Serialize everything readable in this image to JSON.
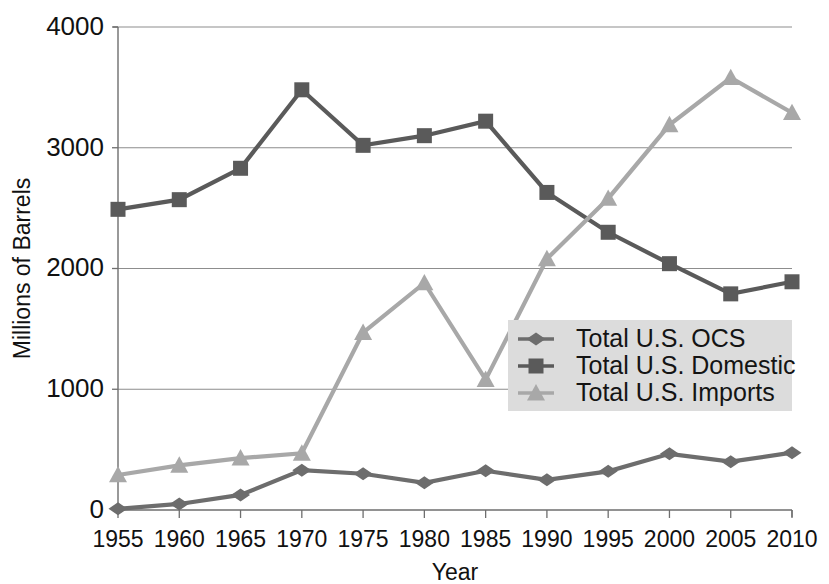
{
  "chart_data": {
    "type": "line",
    "title": "",
    "xlabel": "Year",
    "ylabel": "Millions of Barrels",
    "x": [
      1955,
      1960,
      1965,
      1970,
      1975,
      1980,
      1985,
      1990,
      1995,
      2000,
      2005,
      2010
    ],
    "categories": [
      "1955",
      "1960",
      "1965",
      "1970",
      "1975",
      "1980",
      "1985",
      "1990",
      "1995",
      "2000",
      "2005",
      "2010"
    ],
    "xlim": [
      1955,
      2010
    ],
    "ylim": [
      0,
      4000
    ],
    "yticks": [
      0,
      1000,
      2000,
      3000,
      4000
    ],
    "ytick_labels": [
      "0",
      "1000",
      "2000",
      "3000",
      "4000"
    ],
    "grid": "horizontal",
    "legend_position": "center-right",
    "series": [
      {
        "name": "Total U.S. OCS",
        "marker": "diamond",
        "color": "#6d6d6d",
        "values": [
          10,
          50,
          125,
          330,
          300,
          225,
          325,
          250,
          320,
          465,
          400,
          475
        ]
      },
      {
        "name": "Total U.S. Domestic",
        "marker": "square",
        "color": "#5a5a5a",
        "values": [
          2490,
          2570,
          2830,
          3480,
          3020,
          3100,
          3220,
          2630,
          2300,
          2040,
          1790,
          1890
        ]
      },
      {
        "name": "Total U.S. Imports",
        "marker": "triangle",
        "color": "#a8a8a8",
        "values": [
          290,
          370,
          430,
          470,
          1470,
          1880,
          1080,
          2080,
          2580,
          3190,
          3580,
          3290
        ]
      }
    ]
  },
  "legend": {
    "items": [
      {
        "label": "Total U.S. OCS"
      },
      {
        "label": "Total U.S. Domestic"
      },
      {
        "label": "Total U.S. Imports"
      }
    ],
    "background": "#dcdcdc"
  },
  "axes": {
    "x_title": "Year",
    "y_title": "Millions of Barrels"
  }
}
